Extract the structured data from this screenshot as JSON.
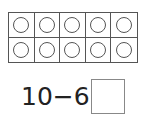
{
  "ten_frame": {
    "rows": 2,
    "columns": 5,
    "cells": [
      {
        "filled": false
      },
      {
        "filled": false
      },
      {
        "filled": false
      },
      {
        "filled": false
      },
      {
        "filled": false
      },
      {
        "filled": false
      },
      {
        "filled": false
      },
      {
        "filled": false
      },
      {
        "filled": false
      },
      {
        "filled": false
      }
    ]
  },
  "equation": {
    "text": "10−6=",
    "answer": ""
  },
  "colors": {
    "line": "#555555",
    "text": "#222222",
    "background": "#ffffff"
  }
}
